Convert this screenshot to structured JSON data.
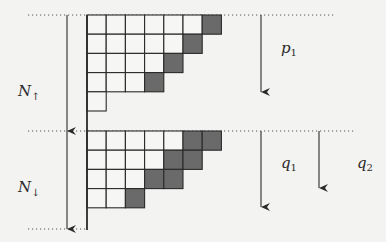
{
  "diagram": {
    "colors": {
      "ink": "#2a2a2a",
      "filled": "#6a6a6a",
      "empty": "#f6f6f4",
      "background": "#f3f3f1"
    },
    "upper_grid": {
      "name": "spin-up-block",
      "rows": [
        {
          "cells": 7,
          "filled": 1
        },
        {
          "cells": 6,
          "filled": 1
        },
        {
          "cells": 5,
          "filled": 1
        },
        {
          "cells": 4,
          "filled": 1
        },
        {
          "cells": 1,
          "filled": 0
        }
      ]
    },
    "lower_grid": {
      "name": "spin-down-block",
      "rows": [
        {
          "cells": 7,
          "filled": 2
        },
        {
          "cells": 6,
          "filled": 2
        },
        {
          "cells": 5,
          "filled": 2
        },
        {
          "cells": 3,
          "filled": 1
        }
      ]
    },
    "labels": {
      "n_up": {
        "main": "N",
        "sub": "↑"
      },
      "n_down": {
        "main": "N",
        "sub": "↓"
      },
      "p1": {
        "main": "p",
        "sub": "1"
      },
      "q1": {
        "main": "q",
        "sub": "1"
      },
      "q2": {
        "main": "q",
        "sub": "2"
      }
    }
  }
}
